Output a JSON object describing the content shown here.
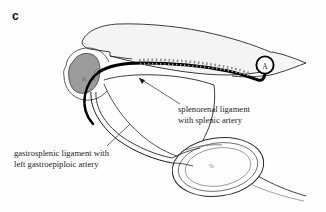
{
  "figure": {
    "panel_letter": "c",
    "background_color": "#fefefe",
    "width": 326,
    "height": 212,
    "type": "anatomical-line-diagram"
  },
  "labels": {
    "splenorenal": "splenorenal ligament\nwith splenic artery",
    "gastrosplenic": "gastrosplenic ligament with\nleft gastroepiploic artery"
  },
  "markers": {
    "aorta_marker": "A",
    "kidney_tag": "K",
    "stomach_tag": "St"
  },
  "colors": {
    "ink": "#141414",
    "artery": "#000000",
    "kidney_fill": "#9b9b9b",
    "pancreas_fill": "#f2f2f2",
    "hatch": "#8d8d8d",
    "leader": "#4a4a4a",
    "faint_tag": "#6d6d6d"
  },
  "structures": [
    {
      "name": "pancreas-tail-outline",
      "style": "thin-outline-light-fill"
    },
    {
      "name": "kidney",
      "style": "gray-filled-bean"
    },
    {
      "name": "splenic-artery",
      "style": "thick-black-curve"
    },
    {
      "name": "peritoneal-hatching",
      "style": "gray-dashed-row"
    },
    {
      "name": "splenorenal-ligament",
      "style": "double-thin-line"
    },
    {
      "name": "gastrosplenic-ligament",
      "style": "double-thin-line"
    },
    {
      "name": "stomach-cross-section",
      "style": "concentric-oval"
    },
    {
      "name": "aorta-marker",
      "style": "small-circle-label"
    }
  ]
}
